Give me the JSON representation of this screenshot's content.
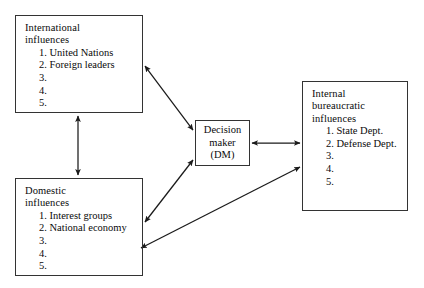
{
  "diagram": {
    "type": "influence-flow-diagram",
    "background_color": "#ffffff",
    "line_color": "#1a1a1a",
    "nodes": [
      {
        "id": "international",
        "title_line1": "International",
        "title_line2": "influences",
        "items": [
          {
            "num": "1.",
            "text": "United Nations"
          },
          {
            "num": "2.",
            "text": "Foreign leaders"
          },
          {
            "num": "3.",
            "text": ""
          },
          {
            "num": "4.",
            "text": ""
          },
          {
            "num": "5.",
            "text": ""
          }
        ]
      },
      {
        "id": "domestic",
        "title_line1": "Domestic",
        "title_line2": "influences",
        "items": [
          {
            "num": "1.",
            "text": "Interest groups"
          },
          {
            "num": "2.",
            "text": "National economy"
          },
          {
            "num": "3.",
            "text": ""
          },
          {
            "num": "4.",
            "text": ""
          },
          {
            "num": "5.",
            "text": ""
          }
        ]
      },
      {
        "id": "internal",
        "title_line1": "Internal",
        "title_line2": "bureaucratic",
        "title_line3": "influences",
        "items": [
          {
            "num": "1.",
            "text": "State Dept."
          },
          {
            "num": "2.",
            "text": "Defense Dept."
          },
          {
            "num": "3.",
            "text": ""
          },
          {
            "num": "4.",
            "text": ""
          },
          {
            "num": "5.",
            "text": ""
          }
        ]
      }
    ],
    "center_node": {
      "id": "decision-maker",
      "line1": "Decision",
      "line2": "maker",
      "line3": "(DM)"
    },
    "connectors": [
      {
        "id": "international-dm",
        "from": "international",
        "to": "decision-maker",
        "style": "double-headed"
      },
      {
        "id": "domestic-dm",
        "from": "domestic",
        "to": "decision-maker",
        "style": "double-headed"
      },
      {
        "id": "dm-internal",
        "from": "decision-maker",
        "to": "internal",
        "style": "double-headed"
      },
      {
        "id": "international-domestic",
        "from": "international",
        "to": "domestic",
        "style": "double-headed"
      },
      {
        "id": "internal-domestic",
        "from": "internal",
        "to": "domestic",
        "style": "double-headed"
      }
    ]
  }
}
